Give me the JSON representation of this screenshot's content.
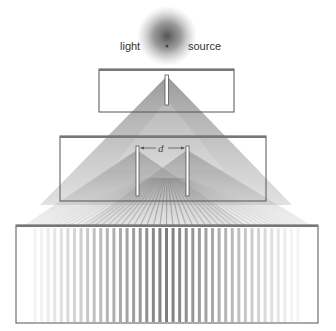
{
  "labels": {
    "light": "light",
    "source": "source",
    "slit_spacing": "d"
  },
  "colors": {
    "beam": "#555555",
    "frame": "#555555",
    "fringe": "#666666",
    "background": "#ffffff"
  },
  "components": [
    {
      "name": "light-source",
      "type": "glowing point"
    },
    {
      "name": "single-slit-barrier",
      "slits": 1
    },
    {
      "name": "double-slit-barrier",
      "slits": 2,
      "spacing_label": "d"
    },
    {
      "name": "screen",
      "content": "interference fringes"
    }
  ],
  "fringes": {
    "count": 41
  }
}
